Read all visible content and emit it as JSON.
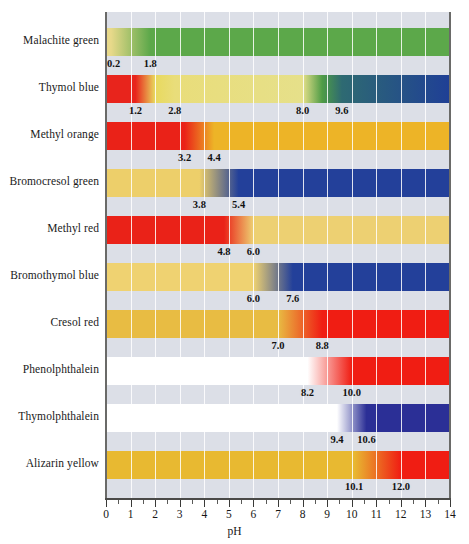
{
  "chart_data": {
    "type": "bar",
    "title": "",
    "xlabel": "pH",
    "ylabel": "",
    "xlim": [
      0,
      14
    ],
    "grid": true,
    "legend": "none",
    "x_ticks": [
      "0",
      "1",
      "2",
      "3",
      "4",
      "5",
      "6",
      "7",
      "8",
      "9",
      "10",
      "11",
      "12",
      "13",
      "14"
    ],
    "categories": [
      "Malachite green",
      "Thymol blue",
      "Methyl orange",
      "Bromocresol green",
      "Methyl red",
      "Bromothymol blue",
      "Cresol red",
      "Phenolphthalein",
      "Thymolphthalein",
      "Alizarin yellow"
    ],
    "series": [
      {
        "name": "Malachite green",
        "transition_low": 0.2,
        "transition_high": 1.8,
        "labels": [
          "0.2",
          "1.8"
        ],
        "acid_color": "#e8d98a",
        "base_color": "#5ca84a",
        "extra_transition": null
      },
      {
        "name": "Thymol blue",
        "transition_low": 1.2,
        "transition_high": 2.8,
        "labels": [
          "1.2",
          "2.8",
          "8.0",
          "9.6"
        ],
        "acid_color": "#e8241c",
        "base_color": "#1f3f96",
        "extra_transition": [
          8.0,
          9.6
        ]
      },
      {
        "name": "Methyl orange",
        "transition_low": 3.2,
        "transition_high": 4.4,
        "labels": [
          "3.2",
          "4.4"
        ],
        "acid_color": "#ea2218",
        "base_color": "#edb427",
        "extra_transition": null
      },
      {
        "name": "Bromocresol green",
        "transition_low": 3.8,
        "transition_high": 5.4,
        "labels": [
          "3.8",
          "5.4"
        ],
        "acid_color": "#edcf6a",
        "base_color": "#23409a",
        "extra_transition": null
      },
      {
        "name": "Methyl red",
        "transition_low": 4.8,
        "transition_high": 6.0,
        "labels": [
          "4.8",
          "6.0"
        ],
        "acid_color": "#ea2218",
        "base_color": "#edd072",
        "extra_transition": null
      },
      {
        "name": "Bromothymol blue",
        "transition_low": 6.0,
        "transition_high": 7.6,
        "labels": [
          "6.0",
          "7.6"
        ],
        "acid_color": "#efd271",
        "base_color": "#23409a",
        "extra_transition": null
      },
      {
        "name": "Cresol red",
        "transition_low": 7.0,
        "transition_high": 8.8,
        "labels": [
          "7.0",
          "8.8"
        ],
        "acid_color": "#e8bc43",
        "base_color": "#f01d13",
        "extra_transition": null
      },
      {
        "name": "Phenolphthalein",
        "transition_low": 8.2,
        "transition_high": 10.0,
        "labels": [
          "8.2",
          "10.0"
        ],
        "acid_color": "#ffffff",
        "base_color": "#f01d13",
        "extra_transition": null
      },
      {
        "name": "Thymolphthalein",
        "transition_low": 9.4,
        "transition_high": 10.6,
        "labels": [
          "9.4",
          "10.6"
        ],
        "acid_color": "#ffffff",
        "base_color": "#2b2f96",
        "extra_transition": null
      },
      {
        "name": "Alizarin yellow",
        "transition_low": 10.1,
        "transition_high": 12.0,
        "labels": [
          "10.1",
          "12.0"
        ],
        "acid_color": "#e8b931",
        "base_color": "#f01d13",
        "extra_transition": null
      }
    ]
  },
  "axis": {
    "x_title": "pH",
    "x_min": "0",
    "x_max": "14"
  },
  "colors": {
    "panel_background": "#dcdfe7",
    "grid_line": "#ffffff",
    "axis_line": "#4a4a48",
    "text": "#151515"
  },
  "rows": [
    {
      "label": "Malachite green",
      "num_labels": [
        {
          "text": "0.2",
          "ph": 0.2,
          "edge": true
        },
        {
          "text": "1.8",
          "ph": 1.8,
          "edge": false
        }
      ]
    },
    {
      "label": "Thymol blue",
      "num_labels": [
        {
          "text": "1.2",
          "ph": 1.2,
          "edge": false
        },
        {
          "text": "2.8",
          "ph": 2.8,
          "edge": false
        },
        {
          "text": "8.0",
          "ph": 8.0,
          "edge": false
        },
        {
          "text": "9.6",
          "ph": 9.6,
          "edge": false
        }
      ]
    },
    {
      "label": "Methyl orange",
      "num_labels": [
        {
          "text": "3.2",
          "ph": 3.2,
          "edge": false
        },
        {
          "text": "4.4",
          "ph": 4.4,
          "edge": false
        }
      ]
    },
    {
      "label": "Bromocresol green",
      "num_labels": [
        {
          "text": "3.8",
          "ph": 3.8,
          "edge": false
        },
        {
          "text": "5.4",
          "ph": 5.4,
          "edge": false
        }
      ]
    },
    {
      "label": "Methyl red",
      "num_labels": [
        {
          "text": "4.8",
          "ph": 4.8,
          "edge": false
        },
        {
          "text": "6.0",
          "ph": 6.0,
          "edge": false
        }
      ]
    },
    {
      "label": "Bromothymol blue",
      "num_labels": [
        {
          "text": "6.0",
          "ph": 6.0,
          "edge": false
        },
        {
          "text": "7.6",
          "ph": 7.6,
          "edge": false
        }
      ]
    },
    {
      "label": "Cresol red",
      "num_labels": [
        {
          "text": "7.0",
          "ph": 7.0,
          "edge": false
        },
        {
          "text": "8.8",
          "ph": 8.8,
          "edge": false
        }
      ]
    },
    {
      "label": "Phenolphthalein",
      "num_labels": [
        {
          "text": "8.2",
          "ph": 8.2,
          "edge": false
        },
        {
          "text": "10.0",
          "ph": 10.0,
          "edge": false
        }
      ]
    },
    {
      "label": "Thymolphthalein",
      "num_labels": [
        {
          "text": "9.4",
          "ph": 9.4,
          "edge": false
        },
        {
          "text": "10.6",
          "ph": 10.6,
          "edge": false
        }
      ]
    },
    {
      "label": "Alizarin yellow",
      "num_labels": [
        {
          "text": "10.1",
          "ph": 10.1,
          "edge": false
        },
        {
          "text": "12.0",
          "ph": 12.0,
          "edge": false
        }
      ]
    }
  ]
}
